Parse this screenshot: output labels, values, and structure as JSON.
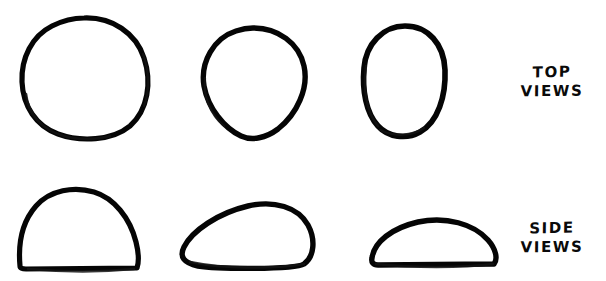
{
  "figure": {
    "background_color": "#ffffff",
    "ink_color": "#050505",
    "width": 606,
    "height": 281
  },
  "labels": {
    "top": {
      "line1": "TOP",
      "line2": "VIEWS"
    },
    "side": {
      "line1": "SIDE",
      "line2": "VIEWS"
    }
  },
  "rows": [
    {
      "name": "top-views",
      "label_line1": "TOP",
      "label_line2": "VIEWS",
      "shapes": [
        {
          "name": "rough-circle",
          "description": "rough hand-drawn circle, double-traced lower-left arc"
        },
        {
          "name": "egg-oval",
          "description": "egg shape, wide rounded top tapering to narrower rounded bottom"
        },
        {
          "name": "narrow-oval",
          "description": "narrow vertical oval, slightly wider at the top"
        }
      ]
    },
    {
      "name": "side-views",
      "label_line1": "SIDE",
      "label_line2": "VIEWS",
      "shapes": [
        {
          "name": "tall-dome",
          "description": "tall dome with flat base and rounded top"
        },
        {
          "name": "wedge-dome",
          "description": "asymmetric wedge, peak right of centre sloping down to the left"
        },
        {
          "name": "low-dome",
          "description": "low flattened dome with long flat base"
        }
      ]
    }
  ]
}
